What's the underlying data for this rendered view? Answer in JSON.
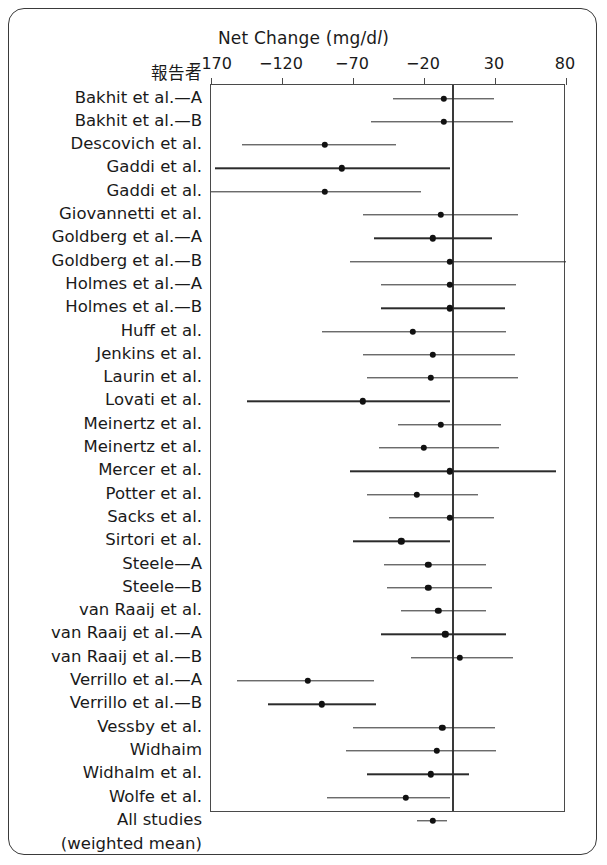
{
  "figure": {
    "title_prefix": "Net Change (mg/d",
    "title_unit_l": "l",
    "title_suffix": ")",
    "author_column_header": "報告者",
    "weighted_mean_note": "(weighted mean)"
  },
  "chart_data": {
    "type": "scatter",
    "subtype": "forest-plot",
    "title": "Net Change (mg/dl)",
    "xlabel": "Net Change (mg/dl)",
    "ylabel": "報告者",
    "xlim": [
      -170,
      80
    ],
    "xticks": [
      -170,
      -120,
      -70,
      -20,
      30,
      80
    ],
    "xtick_labels": [
      "−170",
      "−120",
      "−70",
      "−20",
      "30",
      "80"
    ],
    "grid": false,
    "legend": false,
    "reference_line": 0,
    "categories": [
      "Bakhit et al.—A",
      "Bakhit et al.—B",
      "Descovich et al.",
      "Gaddi et al.",
      "Gaddi et al.",
      "Giovannetti et al.",
      "Goldberg et al.—A",
      "Goldberg et al.—B",
      "Holmes et al.—A",
      "Holmes et al.—B",
      "Huff et al.",
      "Jenkins et al.",
      "Laurin et al.",
      "Lovati et al.",
      "Meinertz et al.",
      "Meinertz et al.",
      "Mercer et al.",
      "Potter et al.",
      "Sacks et al.",
      "Sirtori et al.",
      "Steele—A",
      "Steele—B",
      "van Raaij et al.",
      "van Raaij et al.—A",
      "van Raaij et al.—B",
      "Verrillo et al.—A",
      "Verrillo et al.—B",
      "Vessby et al.",
      "Widhaim",
      "Widhalm et al.",
      "Wolfe et al.",
      "All studies"
    ],
    "points": [
      {
        "label": "Bakhit et al.—A",
        "estimate": -6,
        "low": -42,
        "high": 29
      },
      {
        "label": "Bakhit et al.—B",
        "estimate": -6,
        "low": -57,
        "high": 43
      },
      {
        "label": "Descovich et al.",
        "estimate": -90,
        "low": -148,
        "high": -40
      },
      {
        "label": "Gaddi et al.",
        "estimate": -78,
        "low": -167,
        "high": -2
      },
      {
        "label": "Gaddi et al.",
        "estimate": -90,
        "low": -170,
        "high": -22
      },
      {
        "label": "Giovannetti et al.",
        "estimate": -8,
        "low": -63,
        "high": 46
      },
      {
        "label": "Goldberg et al.—A",
        "estimate": -14,
        "low": -55,
        "high": 28
      },
      {
        "label": "Goldberg et al.—B",
        "estimate": -2,
        "low": -72,
        "high": 80
      },
      {
        "label": "Holmes et al.—A",
        "estimate": -2,
        "low": -50,
        "high": 45
      },
      {
        "label": "Holmes et al.—B",
        "estimate": -2,
        "low": -50,
        "high": 37
      },
      {
        "label": "Huff et al.",
        "estimate": -28,
        "low": -92,
        "high": 38
      },
      {
        "label": "Jenkins et al.",
        "estimate": -14,
        "low": -63,
        "high": 44
      },
      {
        "label": "Laurin et al.",
        "estimate": -15,
        "low": -60,
        "high": 46
      },
      {
        "label": "Lovati et al.",
        "estimate": -63,
        "low": -145,
        "high": -2
      },
      {
        "label": "Meinertz et al.",
        "estimate": -8,
        "low": -38,
        "high": 34
      },
      {
        "label": "Meinertz et al.",
        "estimate": -20,
        "low": -52,
        "high": 33
      },
      {
        "label": "Mercer et al.",
        "estimate": -2,
        "low": -72,
        "high": 73
      },
      {
        "label": "Potter et al.",
        "estimate": -25,
        "low": -60,
        "high": 18
      },
      {
        "label": "Sacks et al.",
        "estimate": -2,
        "low": -45,
        "high": 29
      },
      {
        "label": "Sirtori et al.",
        "estimate": -36,
        "low": -70,
        "high": -2
      },
      {
        "label": "Steele—A",
        "estimate": -17,
        "low": -48,
        "high": 24
      },
      {
        "label": "Steele—B",
        "estimate": -17,
        "low": -46,
        "high": 28
      },
      {
        "label": "van Raaij et al.",
        "estimate": -10,
        "low": -36,
        "high": 24
      },
      {
        "label": "van Raaij et al.—A",
        "estimate": -5,
        "low": -50,
        "high": 38
      },
      {
        "label": "van Raaij et al.—B",
        "estimate": 5,
        "low": -29,
        "high": 43
      },
      {
        "label": "Verrillo et al.—A",
        "estimate": -102,
        "low": -152,
        "high": -55
      },
      {
        "label": "Verrillo et al.—B",
        "estimate": -92,
        "low": -130,
        "high": -54
      },
      {
        "label": "Vessby et al.",
        "estimate": -7,
        "low": -70,
        "high": 30
      },
      {
        "label": "Widhaim",
        "estimate": -11,
        "low": -75,
        "high": 31
      },
      {
        "label": "Widhalm et al.",
        "estimate": -15,
        "low": -60,
        "high": 12
      },
      {
        "label": "Wolfe et al.",
        "estimate": -33,
        "low": -88,
        "high": -2
      },
      {
        "label": "All studies",
        "estimate": -14,
        "low": -25,
        "high": -4
      }
    ]
  },
  "colors": {
    "frame": "#3a3a3a",
    "axis": "#4a4a4a",
    "point": "#111111",
    "line": "#2b2b2b",
    "text": "#1a1a1a",
    "background": "#ffffff"
  }
}
